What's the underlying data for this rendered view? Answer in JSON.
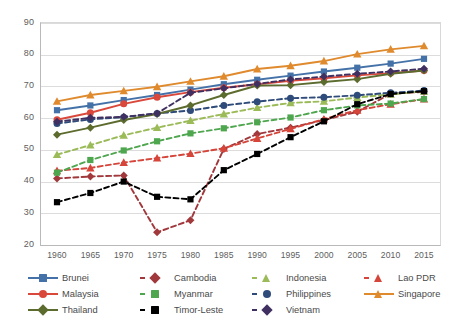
{
  "chart_data": {
    "type": "line",
    "title": "",
    "subtitle": "",
    "xlabel": "",
    "ylabel": "",
    "x": [
      1960,
      1965,
      1970,
      1975,
      1980,
      1985,
      1990,
      1995,
      2000,
      2005,
      2010,
      2015
    ],
    "xtick_labels": [
      "1960",
      "1965",
      "1970",
      "1975",
      "1980",
      "1985",
      "1990",
      "1995",
      "2000",
      "2005",
      "2010",
      "2015"
    ],
    "ytick_labels": [
      "20",
      "30",
      "40",
      "50",
      "60",
      "70",
      "80",
      "90"
    ],
    "yticks": [
      20,
      30,
      40,
      50,
      60,
      70,
      80,
      90
    ],
    "ylim": [
      20,
      90
    ],
    "xlim": [
      1960,
      2015
    ],
    "grid": true,
    "legend_position": "bottom",
    "series": [
      {
        "name": "Brunei",
        "color": "#4472A8",
        "marker": "square",
        "linestyle": "solid",
        "values": [
          62.5,
          64.0,
          65.7,
          67.3,
          69.0,
          70.7,
          72.1,
          73.4,
          74.7,
          75.9,
          77.2,
          78.7
        ]
      },
      {
        "name": "Cambodia",
        "color": "#A1383C",
        "marker": "diamond",
        "linestyle": "dashed",
        "values": [
          41.0,
          41.6,
          41.9,
          24.0,
          27.8,
          50.3,
          55.0,
          57.0,
          59.4,
          62.0,
          67.7,
          68.3
        ]
      },
      {
        "name": "Indonesia",
        "color": "#9BBB59",
        "marker": "triangle",
        "linestyle": "dashed",
        "values": [
          48.5,
          51.5,
          54.6,
          57.0,
          59.2,
          61.3,
          63.3,
          64.8,
          65.3,
          66.5,
          67.5,
          68.5
        ]
      },
      {
        "name": "Lao PDR",
        "color": "#D5453A",
        "marker": "triangle",
        "linestyle": "dashed",
        "values": [
          43.4,
          44.3,
          46.0,
          47.4,
          48.8,
          50.5,
          53.6,
          56.6,
          59.7,
          62.5,
          64.4,
          66.0
        ]
      },
      {
        "name": "Malaysia",
        "color": "#D9483B",
        "marker": "circle",
        "linestyle": "solid",
        "values": [
          59.5,
          61.7,
          64.5,
          66.6,
          68.2,
          69.6,
          70.7,
          71.8,
          72.6,
          73.5,
          74.2,
          75.0
        ]
      },
      {
        "name": "Myanmar",
        "color": "#4EA64E",
        "marker": "square",
        "linestyle": "dashed",
        "values": [
          42.8,
          46.8,
          49.8,
          52.7,
          55.2,
          56.8,
          58.7,
          60.2,
          62.5,
          64.0,
          64.6,
          66.0
        ]
      },
      {
        "name": "Philippines",
        "color": "#2E4B7A",
        "marker": "circle",
        "linestyle": "dashed",
        "values": [
          58.3,
          59.6,
          60.3,
          61.5,
          62.4,
          64.0,
          65.2,
          66.3,
          66.6,
          67.2,
          68.0,
          68.7
        ]
      },
      {
        "name": "Singapore",
        "color": "#E08A2E",
        "marker": "triangle",
        "linestyle": "solid",
        "values": [
          65.3,
          67.3,
          68.6,
          69.9,
          71.6,
          73.2,
          75.5,
          76.5,
          78.0,
          80.2,
          81.7,
          82.8
        ]
      },
      {
        "name": "Thailand",
        "color": "#5C6B2E",
        "marker": "diamond",
        "linestyle": "solid",
        "values": [
          54.8,
          57.0,
          59.4,
          61.3,
          64.0,
          67.3,
          70.3,
          70.4,
          71.4,
          72.3,
          74.0,
          75.0
        ]
      },
      {
        "name": "Timor-Leste",
        "color": "#000000",
        "marker": "square",
        "linestyle": "dashed",
        "values": [
          33.5,
          36.4,
          40.0,
          35.2,
          34.4,
          43.6,
          48.7,
          54.0,
          59.0,
          64.4,
          67.6,
          68.5
        ]
      },
      {
        "name": "Vietnam",
        "color": "#3F3061",
        "marker": "diamond",
        "linestyle": "dashed",
        "values": [
          58.9,
          60.1,
          60.4,
          61.5,
          68.0,
          69.4,
          70.8,
          72.2,
          73.1,
          74.0,
          74.7,
          75.6
        ]
      }
    ]
  },
  "legend": {
    "rows": [
      [
        {
          "name": "Brunei",
          "color": "#4472A8",
          "marker": "square",
          "linestyle": "solid"
        },
        {
          "name": "Cambodia",
          "color": "#A1383C",
          "marker": "diamond",
          "linestyle": "dashed"
        },
        {
          "name": "Indonesia",
          "color": "#9BBB59",
          "marker": "triangle",
          "linestyle": "dashed"
        },
        {
          "name": "Lao PDR",
          "color": "#D5453A",
          "marker": "triangle",
          "linestyle": "dashed"
        }
      ],
      [
        {
          "name": "Malaysia",
          "color": "#D9483B",
          "marker": "circle",
          "linestyle": "solid"
        },
        {
          "name": "Myanmar",
          "color": "#4EA64E",
          "marker": "square",
          "linestyle": "dashed"
        },
        {
          "name": "Philippines",
          "color": "#2E4B7A",
          "marker": "circle",
          "linestyle": "dashed"
        },
        {
          "name": "Singapore",
          "color": "#E08A2E",
          "marker": "triangle",
          "linestyle": "solid"
        }
      ],
      [
        {
          "name": "Thailand",
          "color": "#5C6B2E",
          "marker": "diamond",
          "linestyle": "solid"
        },
        {
          "name": "Timor-Leste",
          "color": "#000000",
          "marker": "square",
          "linestyle": "dashed"
        },
        {
          "name": "Vietnam",
          "color": "#3F3061",
          "marker": "diamond",
          "linestyle": "dashed"
        }
      ]
    ],
    "column_x": [
      0,
      112,
      224,
      336
    ]
  }
}
